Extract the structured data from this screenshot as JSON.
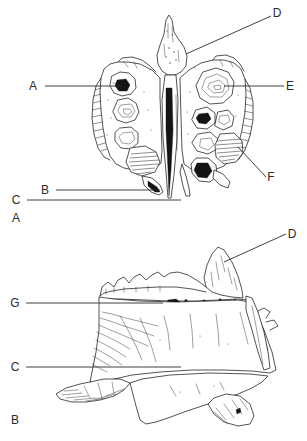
{
  "figure": {
    "background_color": "#ffffff",
    "ink_color": "#1a1a1a",
    "label_color": "#2b2b2b",
    "width": 307,
    "height": 441
  },
  "panels": [
    {
      "id": "panel-a",
      "panel_label": "A",
      "panel_label_x": 16,
      "panel_label_y": 222,
      "view": "anterior",
      "labels": [
        {
          "key": "A",
          "text": "A",
          "text_x": 33,
          "text_y": 90,
          "leader": {
            "x1": 45,
            "y1": 86,
            "x2": 122,
            "y2": 86
          },
          "anchor": "left"
        },
        {
          "key": "D",
          "text": "D",
          "text_x": 273,
          "text_y": 17,
          "leader": {
            "x1": 271,
            "y1": 16,
            "x2": 186,
            "y2": 54
          },
          "anchor": "right"
        },
        {
          "key": "E",
          "text": "E",
          "text_x": 286,
          "text_y": 90,
          "leader": {
            "x1": 284,
            "y1": 86,
            "x2": 224,
            "y2": 86
          },
          "anchor": "right"
        },
        {
          "key": "F",
          "text": "F",
          "text_x": 268,
          "text_y": 181,
          "leader": {
            "x1": 266,
            "y1": 177,
            "x2": 238,
            "y2": 147
          },
          "anchor": "right"
        },
        {
          "key": "B",
          "text": "B",
          "text_x": 44,
          "text_y": 194,
          "leader": {
            "x1": 56,
            "y1": 190,
            "x2": 160,
            "y2": 190
          },
          "anchor": "left"
        },
        {
          "key": "C",
          "text": "C",
          "text_x": 15,
          "text_y": 204,
          "leader": {
            "x1": 27,
            "y1": 200,
            "x2": 181,
            "y2": 200
          },
          "anchor": "left"
        }
      ]
    },
    {
      "id": "panel-b",
      "panel_label": "B",
      "panel_label_x": 15,
      "panel_label_y": 424,
      "view": "lateral",
      "labels": [
        {
          "key": "D",
          "text": "D",
          "text_x": 288,
          "text_y": 238,
          "leader": {
            "x1": 286,
            "y1": 234,
            "x2": 224,
            "y2": 262
          },
          "anchor": "right"
        },
        {
          "key": "G",
          "text": "G",
          "text_x": 13,
          "text_y": 307,
          "leader": {
            "x1": 26,
            "y1": 303,
            "x2": 163,
            "y2": 303
          },
          "anchor": "left"
        },
        {
          "key": "C",
          "text": "C",
          "text_x": 14,
          "text_y": 371,
          "leader": {
            "x1": 26,
            "y1": 367,
            "x2": 181,
            "y2": 367
          },
          "anchor": "left"
        }
      ]
    }
  ]
}
